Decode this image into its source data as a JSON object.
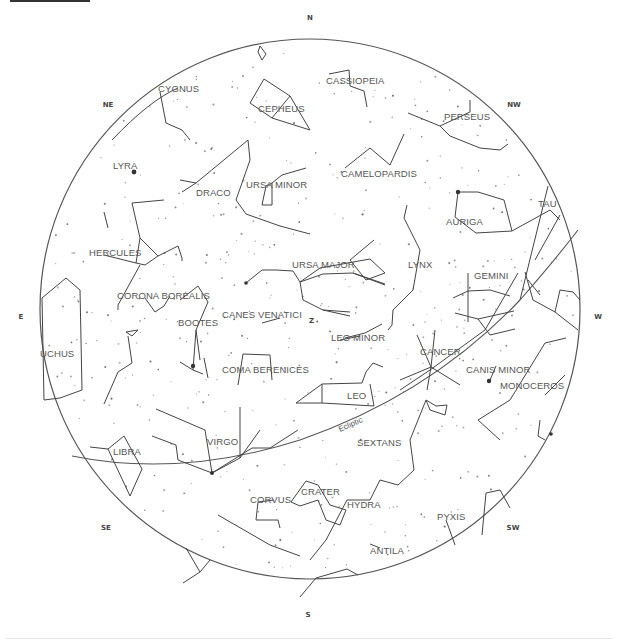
{
  "chart": {
    "center": [
      310,
      309
    ],
    "radius": 270,
    "colors": {
      "lines": "#444444",
      "labels": "#555555",
      "background": "#ffffff"
    }
  },
  "directions": [
    {
      "label": "N",
      "x": 310,
      "y": 20
    },
    {
      "label": "NE",
      "x": 108,
      "y": 107
    },
    {
      "label": "NW",
      "x": 514,
      "y": 107
    },
    {
      "label": "E",
      "x": 21,
      "y": 319
    },
    {
      "label": "W",
      "x": 598,
      "y": 319
    },
    {
      "label": "SE",
      "x": 106,
      "y": 530
    },
    {
      "label": "SW",
      "x": 513,
      "y": 530
    },
    {
      "label": "S",
      "x": 308,
      "y": 617
    }
  ],
  "zenith": {
    "label": "Z",
    "x": 309,
    "y": 323
  },
  "ecliptic": {
    "label": "Ecliptic"
  },
  "constellations": [
    {
      "name": "CYGNUS",
      "x": 158,
      "y": 92
    },
    {
      "name": "CASSIOPEIA",
      "x": 326,
      "y": 84
    },
    {
      "name": "CEPHEUS",
      "x": 258,
      "y": 112
    },
    {
      "name": "PERSEUS",
      "x": 444,
      "y": 120
    },
    {
      "name": "LYRA",
      "x": 113,
      "y": 169
    },
    {
      "name": "DRACO",
      "x": 196,
      "y": 196
    },
    {
      "name": "URSA MINOR",
      "x": 246,
      "y": 188
    },
    {
      "name": "CAMELOPARDIS",
      "x": 341,
      "y": 177
    },
    {
      "name": "AURIGA",
      "x": 446,
      "y": 225
    },
    {
      "name": "TAU",
      "x": 538,
      "y": 207
    },
    {
      "name": "HERCULES",
      "x": 89,
      "y": 256
    },
    {
      "name": "URSA MAJOR",
      "x": 292,
      "y": 268
    },
    {
      "name": "LYNX",
      "x": 408,
      "y": 268
    },
    {
      "name": "CORONA BOREALIS",
      "x": 117,
      "y": 299
    },
    {
      "name": "GEMINI",
      "x": 474,
      "y": 279
    },
    {
      "name": "BOOTES",
      "x": 178,
      "y": 326
    },
    {
      "name": "CANES VENATICI",
      "x": 222,
      "y": 318
    },
    {
      "name": "LEO MINOR",
      "x": 331,
      "y": 341
    },
    {
      "name": "CANCER",
      "x": 420,
      "y": 355
    },
    {
      "name": "OPHIUCHUS",
      "x": 40,
      "y": 357,
      "display": "UCHUS"
    },
    {
      "name": "COMA BERENICES",
      "x": 222,
      "y": 373
    },
    {
      "name": "CANIS MINOR",
      "x": 466,
      "y": 373
    },
    {
      "name": "MONOCEROS",
      "x": 500,
      "y": 389
    },
    {
      "name": "LEO",
      "x": 347,
      "y": 399
    },
    {
      "name": "VIRGO",
      "x": 207,
      "y": 445
    },
    {
      "name": "SEXTANS",
      "x": 357,
      "y": 446
    },
    {
      "name": "LIBRA",
      "x": 113,
      "y": 455
    },
    {
      "name": "CRATER",
      "x": 301,
      "y": 495
    },
    {
      "name": "CORVUS",
      "x": 250,
      "y": 503
    },
    {
      "name": "HYDRA",
      "x": 347,
      "y": 508
    },
    {
      "name": "PYXIS",
      "x": 437,
      "y": 520
    },
    {
      "name": "ANTILA",
      "x": 370,
      "y": 554
    }
  ]
}
